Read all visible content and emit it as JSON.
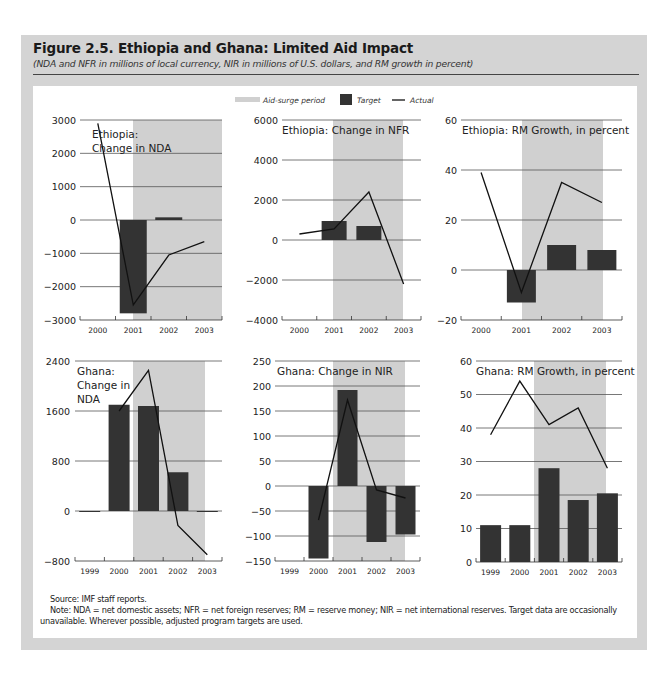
{
  "figure": {
    "title": "Figure 2.5. Ethiopia and Ghana: Limited Aid Impact",
    "subtitle": "(NDA and NFR in millions of local currency, NIR in millions of U.S. dollars, and RM growth in percent)",
    "source": "Source: IMF staff reports.",
    "note": "Note: NDA = net domestic assets; NFR = net foreign reserves; RM = reserve money; NIR = net international reserves. Target data are occasionally unavailable. Wherever possible, adjusted program targets are used."
  },
  "legend": {
    "items": [
      {
        "label": "Aid-surge period",
        "type": "band",
        "color": "#d0d0d0"
      },
      {
        "label": "Target",
        "type": "bar",
        "color": "#333333"
      },
      {
        "label": "Actual",
        "type": "line",
        "color": "#111111"
      }
    ]
  },
  "colors": {
    "frame": "#d4d4d4",
    "panel": "#ffffff",
    "shade": "#d0d0d0",
    "bar": "#333333",
    "line": "#111111",
    "grid": "#555555"
  },
  "chart_data": [
    {
      "type": "bar+line",
      "title": "Ethiopia: Change in NDA",
      "title_lines": [
        "Ethiopia:",
        "Change in NDA"
      ],
      "categories": [
        "2000",
        "2001",
        "2002",
        "2003"
      ],
      "ylim": [
        -3000,
        3000
      ],
      "yticks": [
        3000,
        2000,
        1000,
        0,
        -1000,
        -2000,
        -3000
      ],
      "ytick_labels": [
        "3000",
        "2000",
        "1000",
        "0",
        "−1000",
        "−2000",
        "−3000"
      ],
      "aid_surge": [
        "2001",
        "2003"
      ],
      "series": [
        {
          "name": "Target",
          "kind": "bar",
          "values": [
            null,
            -2800,
            80,
            null
          ]
        },
        {
          "name": "Actual",
          "kind": "line",
          "values": [
            2900,
            -2550,
            -1050,
            -650
          ]
        }
      ],
      "grid": true
    },
    {
      "type": "bar+line",
      "title": "Ethiopia: Change in NFR",
      "title_lines": [
        "Ethiopia: Change in NFR"
      ],
      "categories": [
        "2000",
        "2001",
        "2002",
        "2003"
      ],
      "ylim": [
        -4000,
        6000
      ],
      "yticks": [
        6000,
        4000,
        2000,
        0,
        -2000,
        -4000
      ],
      "ytick_labels": [
        "6000",
        "4000",
        "2000",
        "0",
        "−2000",
        "−4000"
      ],
      "aid_surge": [
        "2001",
        "2003"
      ],
      "series": [
        {
          "name": "Target",
          "kind": "bar",
          "values": [
            null,
            950,
            700,
            null
          ]
        },
        {
          "name": "Actual",
          "kind": "line",
          "values": [
            300,
            550,
            2400,
            -2200
          ]
        }
      ],
      "grid": true
    },
    {
      "type": "bar+line",
      "title": "Ethiopia: RM Growth, in percent",
      "title_lines": [
        "Ethiopia: RM Growth, in percent"
      ],
      "categories": [
        "2000",
        "2001",
        "2002",
        "2003"
      ],
      "ylim": [
        -20,
        60
      ],
      "yticks": [
        60,
        40,
        20,
        0,
        -20
      ],
      "ytick_labels": [
        "60",
        "40",
        "20",
        "0",
        "−20"
      ],
      "aid_surge": [
        "2001",
        "2003"
      ],
      "series": [
        {
          "name": "Target",
          "kind": "bar",
          "values": [
            null,
            -13,
            10,
            8
          ]
        },
        {
          "name": "Actual",
          "kind": "line",
          "values": [
            39,
            -9,
            35,
            27
          ]
        }
      ],
      "grid": true
    },
    {
      "type": "bar+line",
      "title": "Ghana: Change in NDA",
      "title_lines": [
        "Ghana:",
        "Change in",
        "NDA"
      ],
      "categories": [
        "1999",
        "2000",
        "2001",
        "2002",
        "2003"
      ],
      "ylim": [
        -800,
        2400
      ],
      "yticks": [
        2400,
        1600,
        800,
        0,
        -800
      ],
      "ytick_labels": [
        "2400",
        "1600",
        "800",
        "0",
        "−800"
      ],
      "aid_surge": [
        "2001",
        "2003"
      ],
      "series": [
        {
          "name": "Target",
          "kind": "bar",
          "values": [
            0,
            1700,
            1680,
            620,
            0
          ]
        },
        {
          "name": "Actual",
          "kind": "line",
          "values": [
            null,
            1600,
            2250,
            -230,
            -700
          ]
        }
      ],
      "grid": true
    },
    {
      "type": "bar+line",
      "title": "Ghana: Change in NIR",
      "title_lines": [
        "Ghana: Change in NIR"
      ],
      "categories": [
        "1999",
        "2000",
        "2001",
        "2002",
        "2003"
      ],
      "ylim": [
        -150,
        250
      ],
      "yticks": [
        250,
        200,
        150,
        100,
        50,
        0,
        -50,
        -100,
        -150
      ],
      "ytick_labels": [
        "250",
        "200",
        "150",
        "100",
        "50",
        "0",
        "−50",
        "−100",
        "−150"
      ],
      "aid_surge": [
        "2001",
        "2003"
      ],
      "series": [
        {
          "name": "Target",
          "kind": "bar",
          "values": [
            null,
            -145,
            192,
            -112,
            -97
          ]
        },
        {
          "name": "Actual",
          "kind": "line",
          "values": [
            null,
            -68,
            172,
            -8,
            -24
          ]
        }
      ],
      "grid": true
    },
    {
      "type": "bar+line",
      "title": "Ghana: RM Growth, in percent",
      "title_lines": [
        "Ghana: RM Growth, in percent"
      ],
      "categories": [
        "1999",
        "2000",
        "2001",
        "2002",
        "2003"
      ],
      "ylim": [
        0,
        60
      ],
      "yticks": [
        60,
        50,
        40,
        30,
        20,
        10,
        0
      ],
      "ytick_labels": [
        "60",
        "50",
        "40",
        "30",
        "20",
        "10",
        "0"
      ],
      "aid_surge": [
        "2001",
        "2003"
      ],
      "series": [
        {
          "name": "Target",
          "kind": "bar",
          "values": [
            11,
            11,
            28,
            18.5,
            20.5
          ]
        },
        {
          "name": "Actual",
          "kind": "line",
          "values": [
            38,
            54,
            41,
            46,
            28
          ]
        }
      ],
      "grid": true
    }
  ],
  "layout": {
    "panels": [
      {
        "x0": 80,
        "x1": 222,
        "y0": 120,
        "y1": 320,
        "shade": [
          133,
          222
        ],
        "label_x": 76,
        "title_x": 92,
        "title_y": 138,
        "bar_w": 27
      },
      {
        "x0": 282,
        "x1": 421,
        "y0": 120,
        "y1": 320,
        "shade": [
          333,
          403
        ],
        "label_x": 278,
        "title_x": 282,
        "title_y": 134,
        "bar_w": 25
      },
      {
        "x0": 461,
        "x1": 622,
        "y0": 120,
        "y1": 320,
        "shade": [
          522,
          603
        ],
        "label_x": 457,
        "title_x": 462,
        "title_y": 134,
        "bar_w": 29
      },
      {
        "x0": 75,
        "x1": 222,
        "y0": 361,
        "y1": 561,
        "shade": [
          133,
          205
        ],
        "label_x": 70,
        "title_x": 77,
        "title_y": 375,
        "bar_w": 21
      },
      {
        "x0": 275,
        "x1": 420,
        "y0": 361,
        "y1": 561,
        "shade": [
          333,
          405
        ],
        "label_x": 271,
        "title_x": 277,
        "title_y": 375,
        "bar_w": 20
      },
      {
        "x0": 476,
        "x1": 622,
        "y0": 361,
        "y1": 562,
        "shade": [
          534,
          606
        ],
        "label_x": 472,
        "title_x": 476,
        "title_y": 375,
        "bar_w": 21
      }
    ]
  }
}
